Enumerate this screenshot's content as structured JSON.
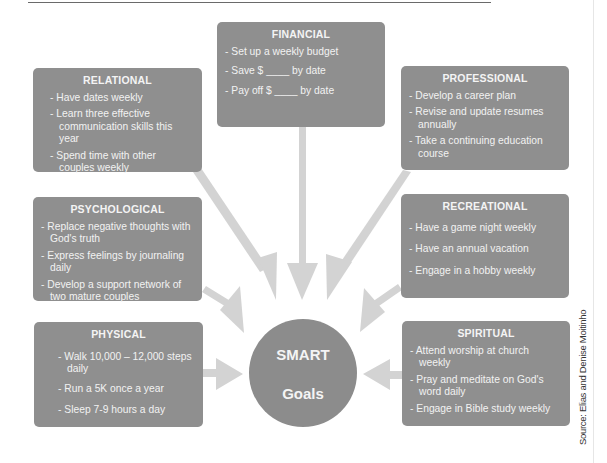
{
  "center": {
    "line1": "SMART",
    "line2": "Goals"
  },
  "boxes": {
    "financial": {
      "title": "FINANCIAL",
      "items": [
        "- Set up a weekly budget",
        "- Save $ ____  by date",
        "- Pay off $ ____  by date"
      ]
    },
    "relational": {
      "title": "RELATIONAL",
      "items": [
        "- Have dates weekly",
        "- Learn three effective communication skills this year",
        "- Spend time with other couples weekly"
      ]
    },
    "professional": {
      "title": "PROFESSIONAL",
      "items": [
        "- Develop a career plan",
        "- Revise and update resumes annually",
        "- Take a continuing education course"
      ]
    },
    "psychological": {
      "title": "PSYCHOLOGICAL",
      "items": [
        "- Replace negative thoughts with God's truth",
        "- Express feelings by journaling daily",
        "- Develop a support network of two mature couples"
      ]
    },
    "recreational": {
      "title": "RECREATIONAL",
      "items": [
        "- Have a game night weekly",
        "- Have an annual vacation",
        "- Engage in a hobby weekly"
      ]
    },
    "physical": {
      "title": "PHYSICAL",
      "items": [
        "- Walk 10,000 – 12,000 steps daily",
        "- Run a 5K once a year",
        "- Sleep 7-9 hours a day"
      ]
    },
    "spiritual": {
      "title": "SPIRITUAL",
      "items": [
        "- Attend worship at church weekly",
        "- Pray and meditate on God's word daily",
        "- Engage in Bible study weekly"
      ]
    }
  },
  "source": "Source: Elias and Denise Moitinho",
  "colors": {
    "box": "#8f8f8f",
    "arrow": "#d3d3d3",
    "text": "#f2f2f2"
  }
}
